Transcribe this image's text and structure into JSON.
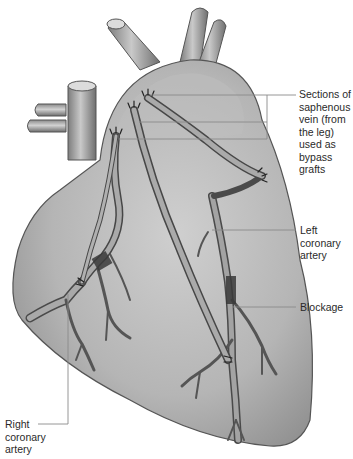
{
  "diagram": {
    "colors": {
      "heart_fill": "#b9b9b9",
      "heart_shade": "#8f8f8f",
      "vessel_fill": "#a8a8a8",
      "vessel_edge": "#4a4a4a",
      "leader_line": "#8a8a8a",
      "text": "#2a2a2a"
    },
    "labels": {
      "saphenous": {
        "lines": [
          "Sections of",
          "saphenous",
          "vein (from",
          "the leg)",
          "used as",
          "bypass",
          "grafts"
        ]
      },
      "left_coronary": {
        "lines": [
          "Left",
          "coronary",
          "artery"
        ]
      },
      "blockage": {
        "lines": [
          "Blockage"
        ]
      },
      "right_coronary": {
        "lines": [
          "Right",
          "coronary",
          "artery"
        ]
      }
    }
  }
}
